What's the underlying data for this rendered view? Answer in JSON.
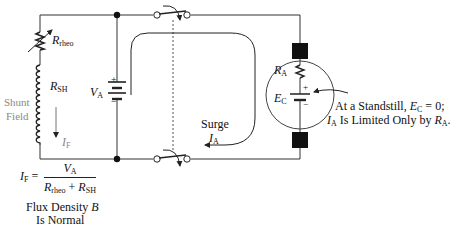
{
  "diagram": {
    "labels": {
      "r_rheo": {
        "sym": "R",
        "sub": "rheo"
      },
      "r_sh": {
        "sym": "R",
        "sub": "SH"
      },
      "shunt_field_line1": "Shunt",
      "shunt_field_line2": "Field",
      "i_f": {
        "sym": "I",
        "sub": "F"
      },
      "v_a": {
        "sym": "V",
        "sub": "A"
      },
      "r_a": {
        "sym": "R",
        "sub": "A"
      },
      "e_c": {
        "sym": "E",
        "sub": "C"
      },
      "surge_line1": "Surge",
      "surge_i": {
        "sym": "I",
        "sub": "A"
      },
      "battery_plus": "+",
      "battery_minus": "−",
      "ec_plus": "+",
      "ec_minus": "−"
    },
    "formula": {
      "lhs_sym": "I",
      "lhs_sub": "F",
      "equals": "=",
      "numerator_sym": "V",
      "numerator_sub": "A",
      "den_a_sym": "R",
      "den_a_sub": "rheo",
      "plus": "+",
      "den_b_sym": "R",
      "den_b_sub": "SH"
    },
    "flux_text": "Flux Density",
    "flux_sym": "B",
    "cut_text": "Is Normal",
    "annotation": {
      "line1_prefix": "At a Standstill, ",
      "line1_sym": "E",
      "line1_sub": "C",
      "line1_suffix": " = 0;",
      "line2_sym": "I",
      "line2_sub": "A",
      "line2_mid": " Is Limited Only by ",
      "line2_sym2": "R",
      "line2_sub2": "A",
      "line2_end": "."
    },
    "colors": {
      "wire": "#333333",
      "label": "#111111",
      "shunt_text": "#888888",
      "brush": "#111111"
    }
  }
}
